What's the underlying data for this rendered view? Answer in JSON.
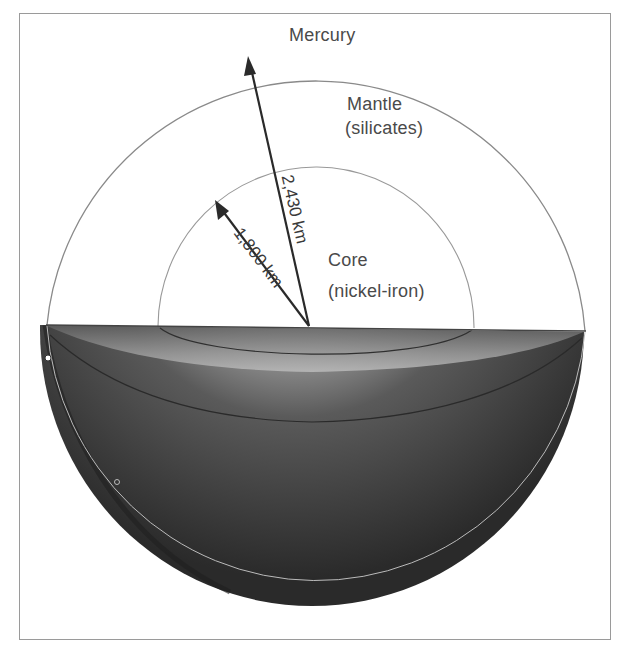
{
  "diagram": {
    "title": "Mercury",
    "layers": [
      {
        "name": "Mantle",
        "composition": "(silicates)"
      },
      {
        "name": "Core",
        "composition": "(nickel-iron)"
      }
    ],
    "radii": [
      {
        "label": "2,430 km",
        "refers_to": "planet radius"
      },
      {
        "label": "1,800 km",
        "refers_to": "core radius"
      }
    ],
    "colors": {
      "frame": "#9a9a9a",
      "outline": "#8a8a8a",
      "arrow": "#2a2a2a",
      "shadow_dark": "#2e2e2e",
      "highlight": "#e6e6e6"
    }
  }
}
